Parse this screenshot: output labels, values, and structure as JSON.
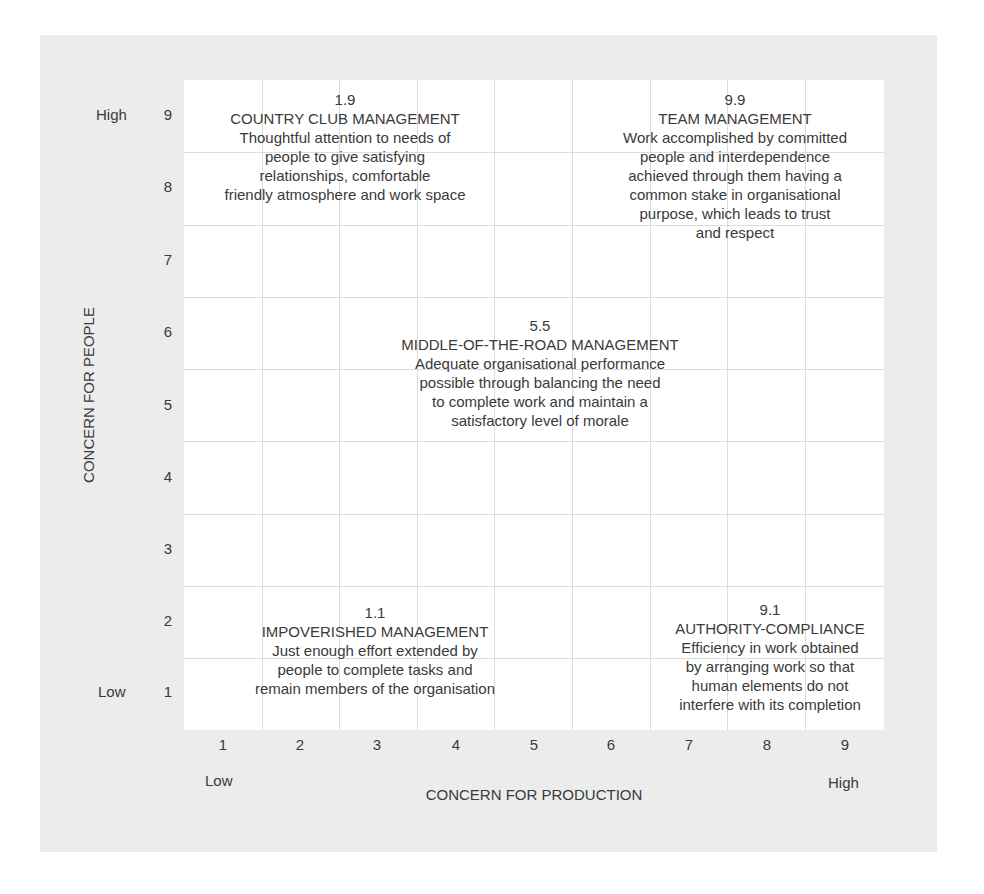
{
  "diagram": {
    "type": "managerial-grid",
    "colors": {
      "panel_background": "#ececec",
      "grid_background": "#ffffff",
      "grid_lines": "#dcdcdc",
      "text": "#3a3a3a"
    },
    "y_axis": {
      "title": "CONCERN FOR PEOPLE",
      "low_label": "Low",
      "high_label": "High",
      "ticks": [
        "1",
        "2",
        "3",
        "4",
        "5",
        "6",
        "7",
        "8",
        "9"
      ]
    },
    "x_axis": {
      "title": "CONCERN FOR PRODUCTION",
      "low_label": "Low",
      "high_label": "High",
      "ticks": [
        "1",
        "2",
        "3",
        "4",
        "5",
        "6",
        "7",
        "8",
        "9"
      ]
    },
    "styles": [
      {
        "code": "1.9",
        "title": "COUNTRY CLUB MANAGEMENT",
        "description": [
          "Thoughtful attention to needs of",
          "people to give satisfying",
          "relationships, comfortable",
          "friendly atmosphere and work space"
        ]
      },
      {
        "code": "9.9",
        "title": "TEAM MANAGEMENT",
        "description": [
          "Work accomplished by committed",
          "people and interdependence",
          "achieved through them having a",
          "common stake in organisational",
          "purpose, which leads to trust",
          "and respect"
        ]
      },
      {
        "code": "5.5",
        "title": "MIDDLE-OF-THE-ROAD MANAGEMENT",
        "description": [
          "Adequate organisational performance",
          "possible through balancing the need",
          "to complete work and maintain a",
          "satisfactory level of morale"
        ]
      },
      {
        "code": "1.1",
        "title": "IMPOVERISHED MANAGEMENT",
        "description": [
          "Just enough effort extended by",
          "people to complete tasks and",
          "remain members of the organisation"
        ]
      },
      {
        "code": "9.1",
        "title": "AUTHORITY-COMPLIANCE",
        "description": [
          "Efficiency in work obtained",
          "by arranging work so that",
          "human elements do not",
          "interfere with its completion"
        ]
      }
    ]
  }
}
